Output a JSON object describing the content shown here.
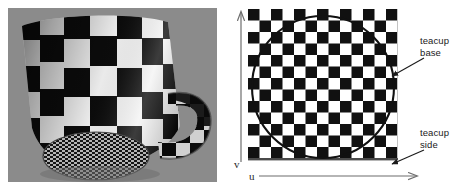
{
  "figure": {
    "type": "texture-mapping-illustration",
    "background_color": "#ffffff",
    "panels": [
      {
        "id": "photo",
        "name": "rendered-teacup-photo",
        "description": "Rendered 3D teacup with checkerboard texture on a gray background",
        "background_color": "#8a8a8a",
        "x": 8,
        "y": 8,
        "width": 209,
        "height": 174
      },
      {
        "id": "texture",
        "name": "uv-texture-map-diagram",
        "description": "Square checkerboard texture image in uv space with a circle marking the teacup base region",
        "x": 237,
        "y": 0,
        "width": 237,
        "height": 196
      }
    ]
  },
  "texture_map": {
    "checker": {
      "columns": 13,
      "rows": 13,
      "cell_size": 11.5,
      "origin_x": 11,
      "origin_y": 9,
      "dark_color": "#111111",
      "light_color": "#ffffff"
    },
    "base_circle": {
      "center_x": 86,
      "center_y": 87,
      "radius": 71,
      "stroke_color": "#111111",
      "stroke_width": 2.1
    },
    "baseline": {
      "color": "#4a4a4a",
      "thickness": 2
    }
  },
  "axes": {
    "u": {
      "label": "u",
      "orientation": "horizontal",
      "direction": "right",
      "arrow": true,
      "color": "#6d6d6d"
    },
    "v": {
      "label": "v",
      "orientation": "vertical",
      "direction": "up",
      "arrow": true,
      "color": "#6d6d6d"
    }
  },
  "callouts": [
    {
      "id": "teacup-base",
      "line1": "teacup",
      "line2": "base",
      "arrow_from_x": 424,
      "arrow_from_y": 58,
      "arrow_to_x": 392,
      "arrow_to_y": 76,
      "color": "#1a1a1a"
    },
    {
      "id": "teacup-side",
      "line1": "teacup",
      "line2": "side",
      "arrow_from_x": 424,
      "arrow_from_y": 150,
      "arrow_to_x": 392,
      "arrow_to_y": 166,
      "color": "#1a1a1a"
    }
  ],
  "photo": {
    "subject": "teacup",
    "texture": "black and white checkerboard",
    "parts": [
      "cup-body",
      "cup-handle",
      "cup-base-ellipse"
    ],
    "background_color": "#8a8a8a"
  }
}
